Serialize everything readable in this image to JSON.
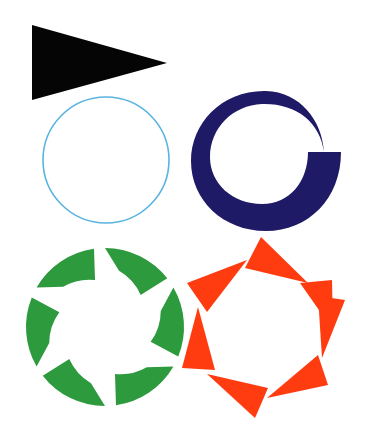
{
  "canvas": {
    "width": 365,
    "height": 444,
    "background": "#ffffff"
  },
  "shapes": {
    "triangle": {
      "label": "black triangle pointing right",
      "color": "#050505",
      "points": "32,25 32,100 167,63"
    },
    "circle": {
      "label": "thin blue circle outline",
      "stroke": "#5ab4e0",
      "cx": 106,
      "cy": 160,
      "r": 63,
      "stroke_width": 1.6
    },
    "spiral_ring": {
      "label": "navy crescent ring with tapering tail",
      "color": "#1f1a66"
    },
    "green_ring": {
      "label": "green ring of six curved arrow segments",
      "color": "#2e9a3e",
      "cx": 105,
      "cy": 327,
      "r_outer": 79,
      "r_inner": 52,
      "segments": 6
    },
    "red_ring": {
      "label": "red-orange ring of triangles",
      "color": "#ff3b10",
      "triangles": [
        "261,237 245,268 308,283",
        "187,283 247,260 207,312",
        "198,307 182,368 215,370",
        "207,374 268,388 255,418",
        "267,398 318,355 328,385",
        "300,283 332,280 333,330",
        "318,296 345,300 322,358"
      ]
    }
  }
}
